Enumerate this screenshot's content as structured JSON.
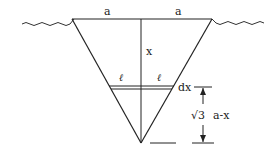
{
  "diagram": {
    "title": "",
    "labels": {
      "half_width_left": "a",
      "half_width_right": "a",
      "depth": "x",
      "strip_half_left": "ℓ",
      "strip_half_right": "ℓ",
      "strip_thickness": "dx",
      "remaining_depth_sqrt": "√3",
      "remaining_depth_expr": "a-x"
    },
    "colors": {
      "stroke": "#222222",
      "background": "#ffffff"
    }
  }
}
